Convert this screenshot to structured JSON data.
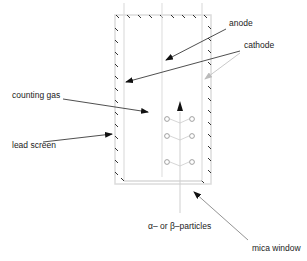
{
  "diagram": {
    "labels": {
      "anode": "anode",
      "cathode": "cathode",
      "counting_gas": "counting gas",
      "lead_screen": "lead screen",
      "particles": "α– or β–particles",
      "mica_window": "mica window"
    },
    "colors": {
      "line": "#d8d8d8",
      "hatch": "#333333",
      "arrow": "#222222",
      "cathode_arrow_right": "#b8b8b8",
      "ion": "#8a8a8a",
      "text": "#222222"
    }
  }
}
